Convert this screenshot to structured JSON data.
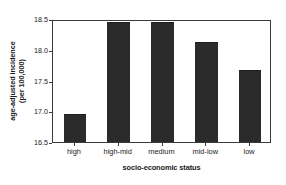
{
  "chart_data": {
    "type": "bar",
    "title": "",
    "subtitle": "",
    "xlabel": "socio-economic status",
    "ylabel_line1": "age-adjusted incidence",
    "ylabel_line2": "(per 100,000)",
    "ylabel": "age-adjusted incidence (per 100,000)",
    "categories": [
      "high",
      "high-mid",
      "medium",
      "mid-low",
      "low"
    ],
    "values": [
      16.95,
      18.45,
      18.45,
      18.12,
      17.67
    ],
    "ylim": [
      16.5,
      18.5
    ],
    "yticks": [
      16.5,
      17.0,
      17.5,
      18.0,
      18.5
    ],
    "ytick_labels": [
      "16.5",
      "17.0",
      "17.5",
      "18.0",
      "18.5"
    ],
    "grid": false,
    "legend": null,
    "legend_position": "none",
    "bar_color": "#2b2b2b",
    "axis_color": "#3a3a3a",
    "background_color": "#ffffff",
    "annotations": []
  }
}
